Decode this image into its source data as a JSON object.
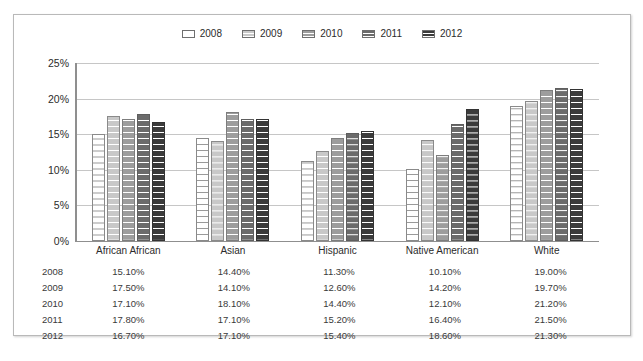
{
  "chart_data": {
    "type": "bar",
    "title": "",
    "subtitle": "",
    "xlabel": "",
    "ylabel": "",
    "ylim": [
      0,
      25
    ],
    "ytick_labels": [
      "0%",
      "5%",
      "10%",
      "15%",
      "20%",
      "25%"
    ],
    "ytick_values": [
      0,
      5,
      10,
      15,
      20,
      25
    ],
    "grid": true,
    "legend_position": "top-center",
    "categories": [
      "African African",
      "Asian",
      "Hispanic",
      "Native American",
      "White"
    ],
    "series": [
      {
        "name": "2008",
        "color": "#ffffff",
        "values": [
          15.1,
          14.4,
          11.3,
          10.1,
          19.0
        ],
        "labels": [
          "15.10%",
          "14.40%",
          "11.30%",
          "10.10%",
          "19.00%"
        ]
      },
      {
        "name": "2009",
        "color": "#c8c8c8",
        "values": [
          17.5,
          14.1,
          12.6,
          14.2,
          19.7
        ],
        "labels": [
          "17.50%",
          "14.10%",
          "12.60%",
          "14.20%",
          "19.70%"
        ]
      },
      {
        "name": "2010",
        "color": "#9d9d9d",
        "values": [
          17.1,
          18.1,
          14.4,
          12.1,
          21.2
        ],
        "labels": [
          "17.10%",
          "18.10%",
          "14.40%",
          "12.10%",
          "21.20%"
        ]
      },
      {
        "name": "2011",
        "color": "#6b6b6b",
        "values": [
          17.8,
          17.1,
          15.2,
          16.4,
          21.5
        ],
        "labels": [
          "17.80%",
          "17.10%",
          "15.20%",
          "16.40%",
          "21.50%"
        ]
      },
      {
        "name": "2012",
        "color": "#3b3b3b",
        "values": [
          16.7,
          17.1,
          15.4,
          18.6,
          21.3
        ],
        "labels": [
          "16.70%",
          "17.10%",
          "15.40%",
          "18.60%",
          "21.30%"
        ]
      }
    ]
  },
  "table": {
    "rows": [
      {
        "year": "2008",
        "values": [
          "15.10%",
          "14.40%",
          "11.30%",
          "10.10%",
          "19.00%"
        ]
      },
      {
        "year": "2009",
        "values": [
          "17.50%",
          "14.10%",
          "12.60%",
          "14.20%",
          "19.70%"
        ]
      },
      {
        "year": "2010",
        "values": [
          "17.10%",
          "18.10%",
          "14.40%",
          "12.10%",
          "21.20%"
        ]
      },
      {
        "year": "2011",
        "values": [
          "17.80%",
          "17.10%",
          "15.20%",
          "16.40%",
          "21.50%"
        ]
      },
      {
        "year": "2012",
        "values": [
          "16.70%",
          "17.10%",
          "15.40%",
          "18.60%",
          "21.30%"
        ]
      }
    ]
  }
}
